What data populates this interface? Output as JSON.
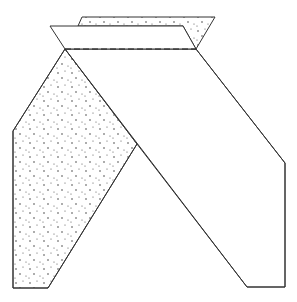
{
  "diagram": {
    "colors": {
      "stroke": "#333333",
      "background": "#ffffff",
      "stipple": "#444444"
    },
    "parts": {
      "back_strip": {
        "shaded": true,
        "label": "back-strip-underside"
      },
      "front_strip": {
        "shaded": false,
        "label": "front-strip-top"
      },
      "fold_line": {
        "style": "dashed",
        "label": "fold-line"
      },
      "left_leg": {
        "shaded": true,
        "label": "left-leg-underside"
      },
      "right_leg": {
        "shaded": false,
        "label": "right-leg-top"
      }
    }
  }
}
